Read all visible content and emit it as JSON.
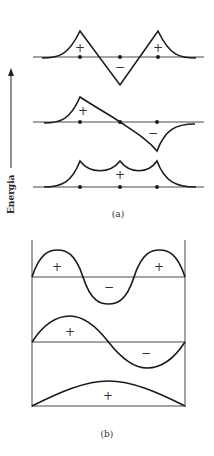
{
  "figure": {
    "axis_label": "Energia",
    "panel_a": {
      "caption": "(a)",
      "levels": [
        {
          "name": "top",
          "signs": [
            "+",
            "−",
            "+"
          ]
        },
        {
          "name": "middle",
          "signs": [
            "+",
            "−"
          ]
        },
        {
          "name": "bottom",
          "signs": [
            "+"
          ]
        }
      ]
    },
    "panel_b": {
      "caption": "(b)",
      "levels": [
        {
          "name": "top",
          "signs": [
            "+",
            "−",
            "+"
          ]
        },
        {
          "name": "middle",
          "signs": [
            "+",
            "−"
          ]
        },
        {
          "name": "bottom",
          "signs": [
            "+"
          ]
        }
      ]
    },
    "colors": {
      "line": "#1a1a1a",
      "background": "#ffffff"
    }
  }
}
